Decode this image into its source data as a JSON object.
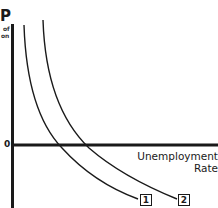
{
  "diagram": {
    "type": "phillips-curve-shift",
    "y_axis": {
      "label_main": "P",
      "label_sub_1": "of",
      "label_sub_2": "on"
    },
    "origin_label": "0",
    "x_axis": {
      "label_line_1": "Unemployment",
      "label_line_2": "Rate"
    },
    "curves": [
      {
        "id": "1",
        "label": "1"
      },
      {
        "id": "2",
        "label": "2"
      }
    ],
    "colors": {
      "ink": "#1a1a1a",
      "background": "#ffffff"
    }
  }
}
